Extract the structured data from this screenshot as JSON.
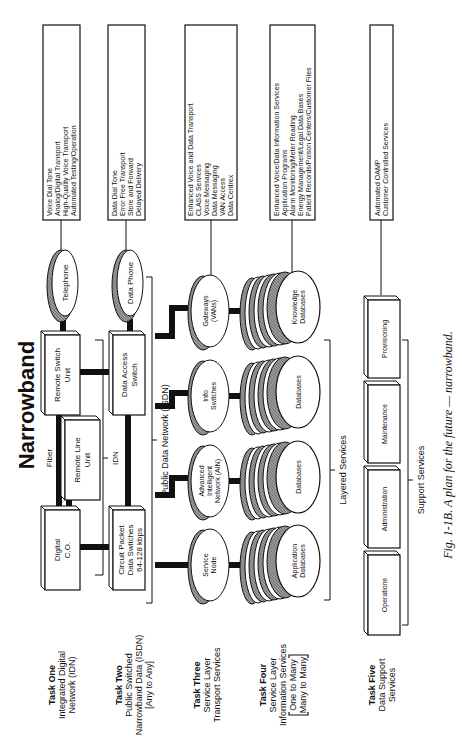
{
  "title": "Narrowband",
  "caption": "Fig. 1-1B. A plan for the future — narrowband.",
  "tasks": [
    {
      "name": "Task One",
      "lines": [
        "Integrated Digital",
        "Network (IDN)"
      ]
    },
    {
      "name": "Task Two",
      "lines": [
        "Public Switched",
        "Narrowband Data (ISDN)",
        "[Any to Any]"
      ]
    },
    {
      "name": "Task Three",
      "lines": [
        "Service Layer",
        "Transport Services"
      ]
    },
    {
      "name": "Task Four",
      "lines": [
        "Service Layer",
        "Information Services",
        "One to Many",
        "Many to Many"
      ]
    },
    {
      "name": "Task Five",
      "lines": [
        "Data Support",
        "Services"
      ]
    }
  ],
  "network_row1": {
    "digital_co": [
      "Digital",
      "C.O."
    ],
    "remote_line_unit": [
      "Remote  Line",
      "Unit"
    ],
    "remote_switch_unit": [
      "Remote  Switch",
      "Unit"
    ],
    "telephone": "Telephone",
    "fiber_label": "Fiber",
    "idn_label": "IDN"
  },
  "network_row2": {
    "circuit_packet": [
      "Circuit  Packet",
      "Data  Switches",
      "64-128  kbps"
    ],
    "data_access_switch": [
      "Data  Access",
      "Switch"
    ],
    "data_phone": "Data  Phone",
    "public_network_label": "Public Data Network (ISDN)"
  },
  "service_nodes": [
    {
      "label": [
        "Service",
        "Node"
      ]
    },
    {
      "label": [
        "Advanced",
        "Intelligent",
        "Network (AIN)"
      ]
    },
    {
      "label": [
        "Info",
        "Switches"
      ]
    },
    {
      "label": [
        "Gateways",
        "(VANs)"
      ]
    }
  ],
  "databases": [
    {
      "label": [
        "Application",
        "Databases"
      ]
    },
    {
      "label": [
        "Databases"
      ]
    },
    {
      "label": [
        "Databases"
      ]
    },
    {
      "label": [
        "Knowledge",
        "Databases"
      ]
    }
  ],
  "layered_services_label": "Layered Services",
  "support_services": {
    "label": "Support Services",
    "items": [
      "Operations",
      "Administration",
      "Maintenance",
      "Provisioning"
    ]
  },
  "feature_boxes": [
    {
      "lines": [
        "Voice Dial Tone",
        "Analog/Digital Transport",
        "High-Quality Voice Transport",
        "Automated Testing/Operation"
      ]
    },
    {
      "lines": [
        "Data Dial Tone",
        "Error Free Transport",
        "Store and Forward",
        "Delayed Delivery"
      ]
    },
    {
      "lines": [
        "Enhanced Voice and Data Transport",
        "CLASS Services",
        "Voice Messaging",
        "Data Messaging",
        "VAN Access",
        "Data Centrex"
      ]
    },
    {
      "lines": [
        "Enhanced Voice/Data Information Services",
        "Application Programs",
        "Alarm Monitoring/Meter Reading",
        "Energy Management/Legal Data Bases",
        "Patient Records/Poison Centers/Customer Files"
      ]
    },
    {
      "lines": [
        "Automated OAMP",
        "Customer Controlled Services"
      ]
    }
  ]
}
